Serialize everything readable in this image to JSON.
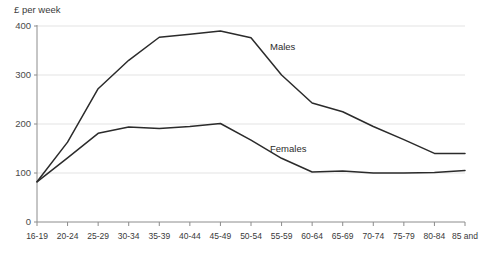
{
  "chart_data": {
    "type": "line",
    "title": "",
    "ylabel": "£ per week",
    "xlabel": "",
    "ylim": [
      0,
      400
    ],
    "yticks": [
      0,
      100,
      200,
      300,
      400
    ],
    "grid": true,
    "legend_position": "inline-annotation",
    "categories": [
      "16-19",
      "20-24",
      "25-29",
      "30-34",
      "35-39",
      "40-44",
      "45-49",
      "50-54",
      "55-59",
      "60-64",
      "65-69",
      "70-74",
      "75-79",
      "80-84",
      "85 and"
    ],
    "series": [
      {
        "name": "Males",
        "values": [
          82,
          163,
          272,
          330,
          377,
          383,
          390,
          376,
          300,
          243,
          225,
          195,
          168,
          140,
          140
        ]
      },
      {
        "name": "Females",
        "values": [
          82,
          131,
          181,
          194,
          191,
          195,
          201,
          167,
          130,
          102,
          104,
          100,
          100,
          101,
          105
        ]
      }
    ],
    "annotations": [
      {
        "text": "Males",
        "x": 270,
        "y": 48
      },
      {
        "text": "Females",
        "x": 270,
        "y": 150
      }
    ],
    "colors": {
      "line": "#2b2b2b",
      "grid": "#e3e3e3",
      "axis": "#8c8c8c",
      "text": "#3a3a3a"
    }
  },
  "axis_title": "£ per week"
}
